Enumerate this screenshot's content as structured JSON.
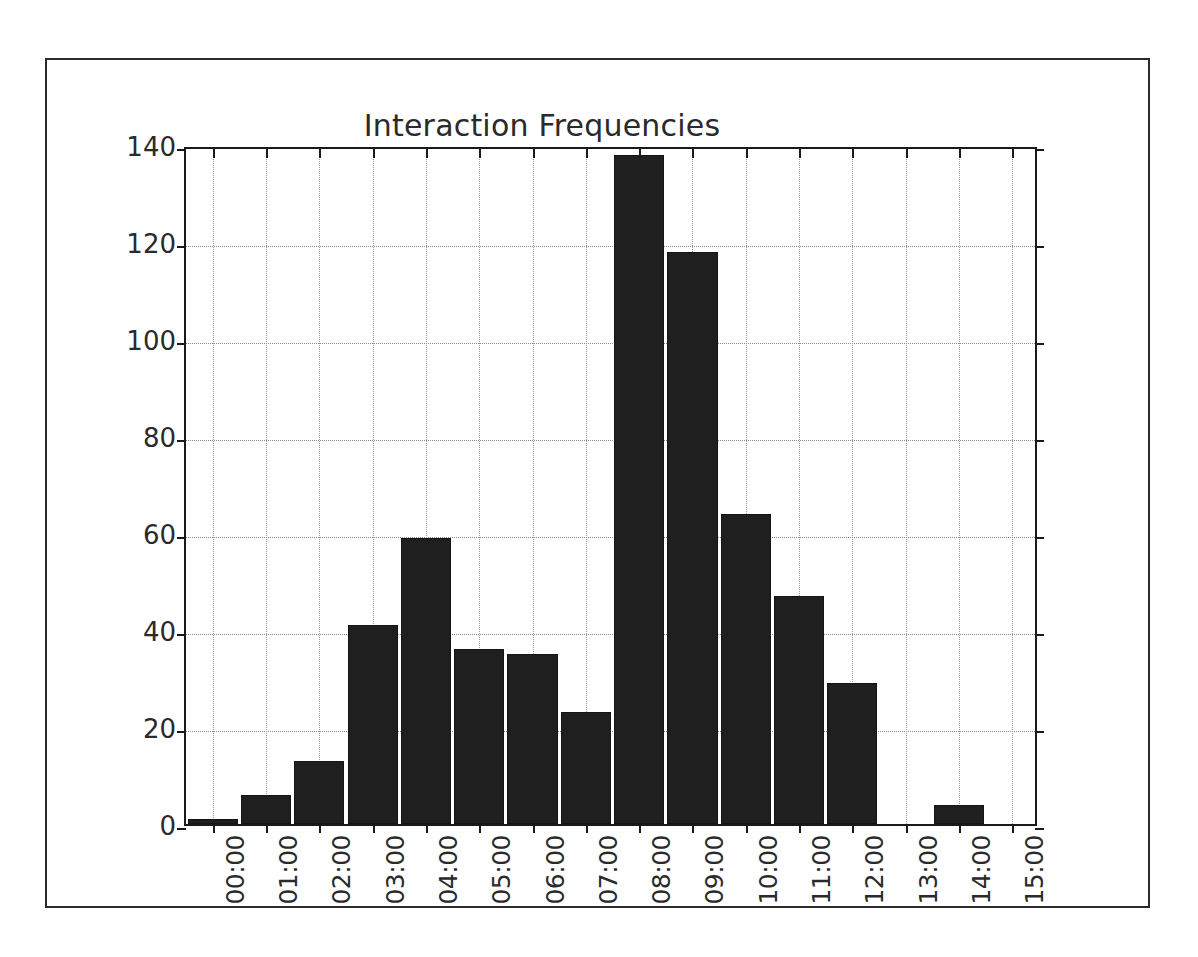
{
  "figure": {
    "background_color": "#ffffff",
    "frame_color": "#2b2b2b",
    "axis_color": "#1a1a1a"
  },
  "chart_data": {
    "type": "bar",
    "title": "Interaction Frequencies",
    "xlabel": "",
    "ylabel": "",
    "categories": [
      "00:00",
      "01:00",
      "02:00",
      "03:00",
      "04:00",
      "05:00",
      "06:00",
      "07:00",
      "08:00",
      "09:00",
      "10:00",
      "11:00",
      "12:00",
      "13:00",
      "14:00",
      "15:00"
    ],
    "values": [
      1,
      6,
      13,
      41,
      59,
      36,
      35,
      23,
      138,
      118,
      64,
      47,
      29,
      0,
      4,
      0
    ],
    "ylim": [
      0,
      140
    ],
    "yticks": [
      0,
      20,
      40,
      60,
      80,
      100,
      120,
      140
    ],
    "ytick_labels": [
      "0",
      "20",
      "40",
      "60",
      "80",
      "100",
      "120",
      "140"
    ],
    "xtick_rotation": 90,
    "grid": true,
    "grid_style": "dotted",
    "legend": null,
    "bar_color": "#1f1f1f",
    "bar_width_ratio": 0.94
  }
}
